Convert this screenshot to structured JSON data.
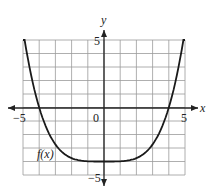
{
  "chart_data": {
    "type": "line",
    "title": "",
    "xlabel": "x",
    "ylabel": "y",
    "xlim": [
      -5,
      5
    ],
    "ylim": [
      -5,
      5
    ],
    "grid": true,
    "x_ticks_labeled": [
      "-5",
      "0",
      "5"
    ],
    "y_ticks_labeled": [
      "5",
      "-5"
    ],
    "series": [
      {
        "name": "f(x)",
        "x": [
          -5,
          -4.5,
          -4,
          -3,
          -2,
          -1,
          0,
          1,
          2,
          3,
          4,
          4.5,
          5
        ],
        "values": [
          5,
          2.4,
          0,
          -2.7,
          -3.75,
          -3.98,
          -4,
          -3.98,
          -3.75,
          -2.7,
          0,
          2.4,
          5
        ]
      }
    ],
    "annotations": [
      "f(x)"
    ]
  },
  "labels": {
    "x_axis": "x",
    "y_axis": "y",
    "x_min": "−5",
    "x_max": "5",
    "origin": "0",
    "y_max": "5",
    "y_min": "−5",
    "curve": "f(x)"
  }
}
